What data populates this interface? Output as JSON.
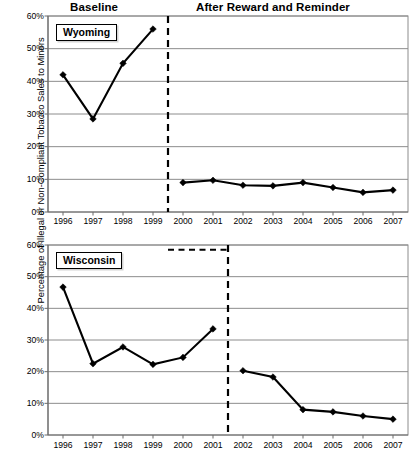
{
  "figure": {
    "ylabel": "Percentage of Illegal or Non-Compliant Tobacco Sales to Minors",
    "headers": {
      "baseline": "Baseline",
      "after": "After Reward and Reminder"
    }
  },
  "axis": {
    "y_ticks": [
      "0%",
      "10%",
      "20%",
      "30%",
      "40%",
      "50%",
      "60%"
    ],
    "x_ticks": [
      "1996",
      "1997",
      "1998",
      "1999",
      "2000",
      "2001",
      "2002",
      "2003",
      "2004",
      "2005",
      "2006",
      "2007"
    ]
  },
  "panels": [
    {
      "id": "wyoming",
      "label": "Wyoming"
    },
    {
      "id": "wisconsin",
      "label": "Wisconsin"
    }
  ],
  "chart_data": [
    {
      "type": "line",
      "title": "Wyoming",
      "xlabel": "",
      "ylabel": "Percentage of Illegal or Non-Compliant Tobacco Sales to Minors",
      "xlim": [
        1995.5,
        2007.5
      ],
      "ylim": [
        0,
        60
      ],
      "yticks": [
        0,
        10,
        20,
        30,
        40,
        50,
        60
      ],
      "ytick_labels": [
        "0%",
        "10%",
        "20%",
        "30%",
        "40%",
        "50%",
        "60%"
      ],
      "grid": true,
      "legend": "none",
      "annotations": [
        {
          "text": "Baseline",
          "x_range": [
            1995.5,
            1999.5
          ]
        },
        {
          "text": "After Reward and Reminder",
          "x_range": [
            1999.5,
            2007.5
          ]
        },
        {
          "type": "vertical-dashed-line",
          "x": 1999.5
        }
      ],
      "series": [
        {
          "name": "Baseline",
          "x": [
            1996,
            1997,
            1998,
            1999
          ],
          "values": [
            42.0,
            28.5,
            45.5,
            56.0
          ]
        },
        {
          "name": "After Reward and Reminder",
          "x": [
            2000,
            2001,
            2002,
            2003,
            2004,
            2005,
            2006,
            2007
          ],
          "values": [
            9.0,
            9.7,
            8.2,
            8.0,
            9.0,
            7.5,
            6.0,
            6.7
          ]
        }
      ]
    },
    {
      "type": "line",
      "title": "Wisconsin",
      "xlabel": "",
      "ylabel": "Percentage of Illegal or Non-Compliant Tobacco Sales to Minors",
      "xlim": [
        1995.5,
        2007.5
      ],
      "ylim": [
        0,
        60
      ],
      "yticks": [
        0,
        10,
        20,
        30,
        40,
        50,
        60
      ],
      "ytick_labels": [
        "0%",
        "10%",
        "20%",
        "30%",
        "40%",
        "50%",
        "60%"
      ],
      "grid": true,
      "legend": "none",
      "annotations": [
        {
          "type": "horizontal-dashed-line",
          "y": 58.5,
          "x_range": [
            1999.5,
            2001.5
          ]
        },
        {
          "type": "vertical-dashed-line",
          "x": 2001.5
        }
      ],
      "series": [
        {
          "name": "Baseline",
          "x": [
            1996,
            1997,
            1998,
            1999,
            2000,
            2001
          ],
          "values": [
            46.7,
            22.5,
            27.8,
            22.3,
            24.5,
            33.5
          ]
        },
        {
          "name": "After Reward and Reminder",
          "x": [
            2002,
            2003,
            2004,
            2005,
            2006,
            2007
          ],
          "values": [
            20.3,
            18.3,
            8.0,
            7.3,
            6.0,
            5.0
          ]
        }
      ]
    }
  ]
}
